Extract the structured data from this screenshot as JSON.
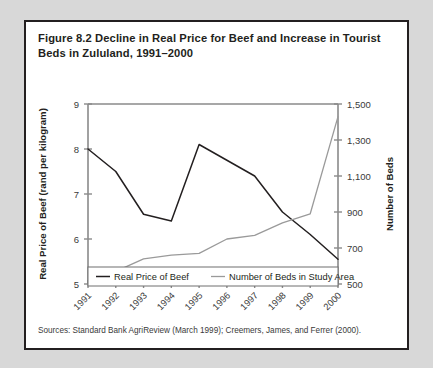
{
  "figure": {
    "title": "Figure 8.2  Decline in Real Price for Beef and Increase in Tourist Beds in Zululand, 1991–2000",
    "source": "Sources: Standard Bank AgriReview (March 1999); Creemers, James, and Ferrer (2000)."
  },
  "chart_data": {
    "type": "line",
    "title": "Figure 8.2  Decline in Real Price for Beef and Increase in Tourist Beds in Zululand, 1991–2000",
    "xlabel": "",
    "categories": [
      "1991",
      "1992",
      "1993",
      "1994",
      "1995",
      "1996",
      "1997",
      "1998",
      "1999",
      "2000"
    ],
    "grid": false,
    "legend_position": "bottom",
    "axes": {
      "left": {
        "label": "Real Price of Beef (rand per kilogram)",
        "ticks": [
          "5",
          "6",
          "7",
          "8",
          "9"
        ],
        "min": 5,
        "max": 9,
        "step": 1
      },
      "right": {
        "label": "Number of Beds",
        "ticks": [
          "500",
          "700",
          "900",
          "1,100",
          "1,300",
          "1,500"
        ],
        "min": 500,
        "max": 1500,
        "step": 200
      }
    },
    "series": [
      {
        "name": "Real Price of Beef",
        "axis": "left",
        "color": "#231f20",
        "values": [
          8.0,
          7.5,
          6.55,
          6.4,
          8.1,
          7.75,
          7.4,
          6.6,
          6.1,
          5.55
        ]
      },
      {
        "name": "Number of Beds in Study Area",
        "axis": "right",
        "color": "#9a9a9a",
        "values": [
          560,
          570,
          640,
          660,
          670,
          750,
          770,
          840,
          890,
          1430
        ]
      }
    ]
  },
  "legend": {
    "items": [
      {
        "label": "Real Price of Beef"
      },
      {
        "label": "Number of Beds in Study Area"
      }
    ]
  }
}
